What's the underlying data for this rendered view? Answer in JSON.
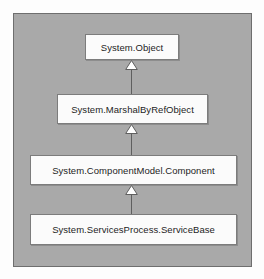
{
  "diagram": {
    "type": "class-inheritance-hierarchy",
    "notation": "UML generalization",
    "panel": {
      "background_color": "#a9a9a9",
      "border_color": "#6e6e6e"
    },
    "box_style": {
      "fill_color": "#fbfbfb",
      "border_color": "#7c7c7c",
      "text_color": "#1d1d1d"
    },
    "connector_style": {
      "arrowhead": "hollow-triangle",
      "arrow_fill": "#ffffff",
      "arrow_border": "#5f5f5f",
      "line_color": "#5f5f5f"
    },
    "nodes": [
      {
        "id": "system-object",
        "label": "System.Object",
        "level": 0
      },
      {
        "id": "marshal-by-ref-object",
        "label": "System.MarshalByRefObject",
        "level": 1
      },
      {
        "id": "component",
        "label": "System.ComponentModel.Component",
        "level": 2
      },
      {
        "id": "service-base",
        "label": "System.ServicesProcess.ServiceBase",
        "level": 3
      }
    ],
    "edges": [
      {
        "id": "edge-0",
        "from": "marshal-by-ref-object",
        "to": "system-object",
        "kind": "inherits"
      },
      {
        "id": "edge-1",
        "from": "component",
        "to": "marshal-by-ref-object",
        "kind": "inherits"
      },
      {
        "id": "edge-2",
        "from": "service-base",
        "to": "component",
        "kind": "inherits"
      }
    ]
  }
}
